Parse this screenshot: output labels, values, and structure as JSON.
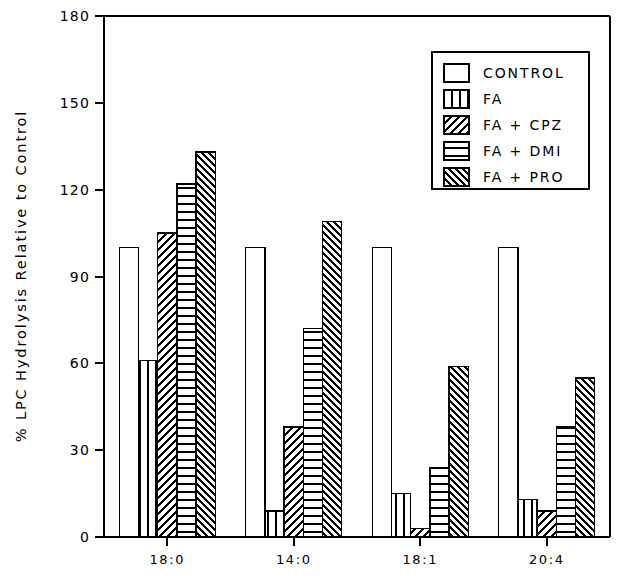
{
  "chart_data": {
    "type": "bar",
    "title": "",
    "subtitle": "",
    "xlabel": "",
    "ylabel": "% LPC Hydrolysis Relative to Control",
    "categories": [
      "18:0",
      "14:0",
      "18:1",
      "20:4"
    ],
    "ylim": [
      0,
      180
    ],
    "yticks": [
      0,
      30,
      60,
      90,
      120,
      150,
      180
    ],
    "ytick_labels": [
      "0",
      "30",
      "60",
      "90",
      "120",
      "150",
      "180"
    ],
    "grid": false,
    "legend_position": "top-right",
    "series": [
      {
        "name": "CONTROL",
        "pattern": "empty",
        "values": [
          100,
          100,
          100,
          100
        ]
      },
      {
        "name": "FA",
        "pattern": "vertical-lines",
        "values": [
          61,
          9,
          15,
          13
        ]
      },
      {
        "name": "FA + CPZ",
        "pattern": "diagonal-forward",
        "values": [
          105,
          38,
          3,
          9
        ]
      },
      {
        "name": "FA + DMI",
        "pattern": "horizontal-lines",
        "values": [
          122,
          72,
          24,
          38
        ]
      },
      {
        "name": "FA + PRO",
        "pattern": "diagonal-backward",
        "values": [
          133,
          109,
          59,
          55
        ]
      }
    ],
    "annotations": []
  },
  "colors": {
    "ink": "#000000",
    "background": "#ffffff"
  }
}
